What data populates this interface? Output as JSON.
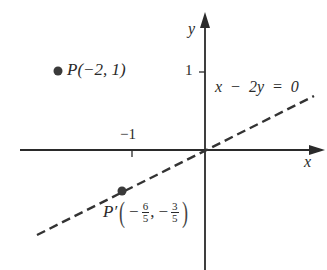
{
  "diagram": {
    "type": "coordinate-plane-reflection",
    "axes": {
      "x_label": "x",
      "y_label": "y",
      "ticks": [
        {
          "axis": "y",
          "value": 1,
          "label": "1"
        },
        {
          "axis": "x",
          "value": -1,
          "label": "−1"
        }
      ]
    },
    "line": {
      "equation": "x − 2y = 0",
      "style": "dashed",
      "color": "#333333"
    },
    "points": [
      {
        "name": "P",
        "label": "P(−2, 1)",
        "x": -2,
        "y": 1
      },
      {
        "name": "P'",
        "label_prefix": "P′",
        "x_num": "6",
        "x_den": "5",
        "y_num": "3",
        "y_den": "5",
        "x_sign": "−",
        "y_sign": "−",
        "x": -1.2,
        "y": -0.6
      }
    ],
    "colors": {
      "ink": "#2a2a2a",
      "point": "#3a3a3a",
      "background": "#ffffff"
    }
  }
}
